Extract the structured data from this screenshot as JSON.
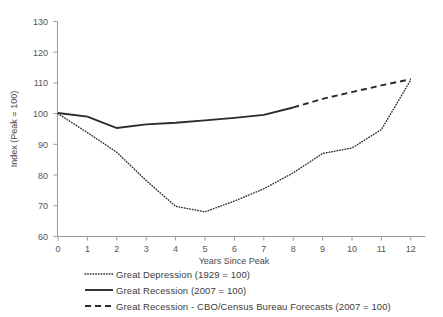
{
  "chart_data": {
    "type": "line",
    "title": "",
    "xlabel": "Years Since Peak",
    "ylabel": "Index (Peak = 100)",
    "xlim": [
      0,
      12
    ],
    "ylim": [
      60,
      130
    ],
    "xticks": [
      "0",
      "1",
      "2",
      "3",
      "4",
      "5",
      "6",
      "7",
      "8",
      "9",
      "10",
      "11",
      "12"
    ],
    "yticks": [
      "60",
      "70",
      "80",
      "90",
      "100",
      "110",
      "120",
      "130"
    ],
    "grid": false,
    "legend_position": "below",
    "x": [
      0,
      1,
      2,
      3,
      4,
      5,
      6,
      7,
      8,
      9,
      10,
      11,
      12
    ],
    "series": [
      {
        "name": "Great Depression (1929 = 100)",
        "style": "dotted",
        "color": "#2b2b2b",
        "x": [
          0,
          1,
          2,
          3,
          4,
          5,
          6,
          7,
          8,
          9,
          10,
          11,
          12
        ],
        "values": [
          100.0,
          93.8,
          87.4,
          78.2,
          69.8,
          68.0,
          71.5,
          75.5,
          80.7,
          87.0,
          88.8,
          84.2,
          88.5
        ]
      },
      {
        "name": "Great Recession (2007 = 100)",
        "style": "solid",
        "color": "#2b2b2b",
        "x": [
          0,
          1,
          2,
          3,
          4,
          5,
          6,
          7,
          8
        ],
        "values": [
          100.2,
          99.0,
          95.3,
          96.5,
          97.0,
          97.8,
          98.6,
          99.6,
          102.0
        ]
      },
      {
        "name": "Great Recession - CBO/Census Bureau Forecasts (2007 = 100)",
        "style": "dashed",
        "color": "#2b2b2b",
        "x": [
          8,
          9,
          10,
          11,
          12
        ],
        "values": [
          102.0,
          104.8,
          107.0,
          109.2,
          111.2
        ]
      }
    ],
    "extra_points": {
      "depression_tail": [
        {
          "x": 10,
          "y": 88.8
        },
        {
          "x": 11,
          "y": 94.8
        },
        {
          "x": 12,
          "y": 111.0
        }
      ]
    }
  },
  "legend": {
    "items": [
      {
        "label": "Great Depression (1929 = 100)",
        "style": "dotted"
      },
      {
        "label": "Great Recession (2007 = 100)",
        "style": "solid"
      },
      {
        "label": "Great Recession - CBO/Census Bureau Forecasts (2007 = 100)",
        "style": "dashed"
      }
    ]
  },
  "axes": {
    "x_title": "Years Since Peak",
    "y_title": "Index (Peak = 100)",
    "y_tick_130": "130",
    "y_tick_120": "120",
    "y_tick_110": "110",
    "y_tick_100": "100",
    "y_tick_90": "90",
    "y_tick_80": "80",
    "y_tick_70": "70",
    "y_tick_60": "60",
    "x_tick_0": "0",
    "x_tick_1": "1",
    "x_tick_2": "2",
    "x_tick_3": "3",
    "x_tick_4": "4",
    "x_tick_5": "5",
    "x_tick_6": "6",
    "x_tick_7": "7",
    "x_tick_8": "8",
    "x_tick_9": "9",
    "x_tick_10": "10",
    "x_tick_11": "11",
    "x_tick_12": "12"
  }
}
